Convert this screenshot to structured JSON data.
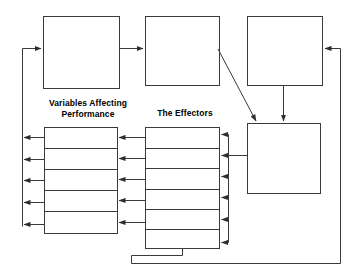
{
  "diagram": {
    "background_color": "#ffffff",
    "stroke_color": "#3a3a3a",
    "stroke_width": 1,
    "labels": {
      "variables_affecting_performance": "Variables Affecting\nPerformance",
      "the_effectors": "The Effectors"
    },
    "top_boxes": [
      {
        "name": "top-box-1",
        "label": "",
        "x": 43,
        "y": 16,
        "w": 76,
        "h": 72
      },
      {
        "name": "top-box-2",
        "label": "",
        "x": 145,
        "y": 16,
        "w": 74,
        "h": 69
      },
      {
        "name": "top-box-3",
        "label": "",
        "x": 247,
        "y": 16,
        "w": 75,
        "h": 69
      }
    ],
    "right_box": {
      "name": "right-box",
      "label": "",
      "x": 247,
      "y": 123,
      "w": 73,
      "h": 70
    },
    "variables_table": {
      "x": 44,
      "y": 127,
      "w": 73,
      "h": 106,
      "row_count": 5,
      "rows": [
        "",
        "",
        "",
        "",
        ""
      ]
    },
    "effectors_table": {
      "x": 145,
      "y": 127,
      "w": 74,
      "h": 121,
      "row_count": 6,
      "rows": [
        "",
        "",
        "",
        "",
        "",
        ""
      ]
    },
    "rails": {
      "left_rail_x": 22,
      "right_rail_x": 228,
      "outer_right_rail_x": 340,
      "bottom_feedback_y": 263,
      "effectors_bottom_loop_y": 255,
      "effectors_bottom_loop_left_x": 131
    },
    "arrow_counts": {
      "left_rail_arrows": 5,
      "inter_table_arrows": 5,
      "right_rail_arrows": 6
    }
  }
}
